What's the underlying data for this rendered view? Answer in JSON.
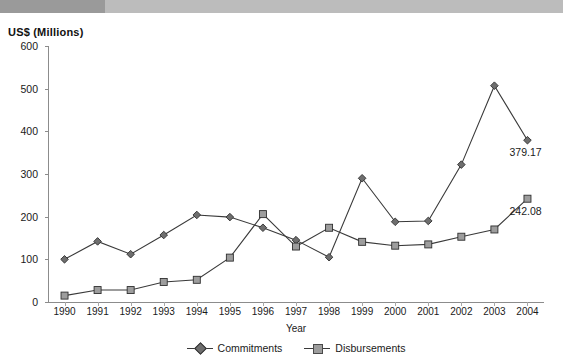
{
  "banner": {
    "present": true,
    "left_color": "#9a9a9a",
    "right_color": "#bcbcbc"
  },
  "axis_title_y": "US$ (Millions)",
  "axis_title_x": "Year",
  "legend": [
    {
      "label": "Commitments",
      "marker": "diamond-marker",
      "color": "#6e6e6e"
    },
    {
      "label": "Disbursements",
      "marker": "square-marker",
      "color": "#9d9d9d"
    }
  ],
  "annotations": [
    {
      "text": "379.17",
      "series": "Commitments",
      "year": "2004"
    },
    {
      "text": "242.08",
      "series": "Disbursements",
      "year": "2004"
    }
  ],
  "chart_data": {
    "type": "line",
    "title": "US$ (Millions)",
    "xlabel": "Year",
    "ylabel": "US$ (Millions)",
    "categories": [
      "1990",
      "1991",
      "1992",
      "1993",
      "1994",
      "1995",
      "1996",
      "1997",
      "1998",
      "1999",
      "2000",
      "2001",
      "2002",
      "2003",
      "2004"
    ],
    "ylim": [
      0,
      600
    ],
    "yticks": [
      0,
      100,
      200,
      300,
      400,
      500,
      600
    ],
    "grid": false,
    "legend_position": "bottom-center",
    "series": [
      {
        "name": "Commitments",
        "marker": "diamond",
        "color": "#6e6e6e",
        "values": [
          100,
          142,
          112,
          157,
          204,
          199,
          174,
          145,
          105,
          290,
          188,
          190,
          322,
          507,
          379.17
        ]
      },
      {
        "name": "Disbursements",
        "marker": "square",
        "color": "#9d9d9d",
        "values": [
          15,
          28,
          28,
          47,
          52,
          104,
          206,
          130,
          174,
          141,
          132,
          135,
          153,
          170,
          242.08
        ]
      }
    ],
    "data_labels": {
      "Commitments": {
        "2004": "379.17"
      },
      "Disbursements": {
        "2004": "242.08"
      }
    }
  }
}
